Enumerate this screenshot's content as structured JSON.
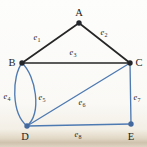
{
  "figure": {
    "type": "graph-diagram"
  },
  "colors": {
    "background": "#fbfaf7",
    "page_edge_strip": "#cfc3ae",
    "edge_black": "#262626",
    "edge_blue": "#4e7ab2",
    "vertex_dark": "#23262b",
    "vertex_blue": "#44699f",
    "label_text": "#2b2b2b"
  },
  "vertices": [
    {
      "id": "A",
      "label": "A",
      "x": 79,
      "y": 23,
      "label_x": 79,
      "label_y": 16,
      "dot": "dark"
    },
    {
      "id": "B",
      "label": "B",
      "x": 22,
      "y": 63,
      "label_x": 12,
      "label_y": 66,
      "dot": "dark"
    },
    {
      "id": "C",
      "label": "C",
      "x": 130,
      "y": 63,
      "label_x": 139,
      "label_y": 66,
      "dot": "dark"
    },
    {
      "id": "D",
      "label": "D",
      "x": 27,
      "y": 126,
      "label_x": 25,
      "label_y": 140,
      "dot": "blue"
    },
    {
      "id": "E",
      "label": "E",
      "x": 131,
      "y": 124,
      "label_x": 131,
      "label_y": 140,
      "dot": "blue"
    }
  ],
  "edges": [
    {
      "id": "e1",
      "symbol": "e",
      "sub": "1",
      "from": "B",
      "to": "A",
      "color": "black",
      "shape": "line",
      "label_x": 37,
      "label_y": 40
    },
    {
      "id": "e2",
      "symbol": "e",
      "sub": "2",
      "from": "A",
      "to": "C",
      "color": "black",
      "shape": "line",
      "label_x": 104,
      "label_y": 35
    },
    {
      "id": "e3",
      "symbol": "e",
      "sub": "3",
      "from": "B",
      "to": "C",
      "color": "black",
      "shape": "line",
      "label_x": 73,
      "label_y": 55
    },
    {
      "id": "e4",
      "symbol": "e",
      "sub": "4",
      "from": "B",
      "to": "D",
      "color": "blue",
      "shape": "curve",
      "c1": [
        12,
        76
      ],
      "c2": [
        11,
        113
      ],
      "label_x": 7,
      "label_y": 99
    },
    {
      "id": "e5",
      "symbol": "e",
      "sub": "5",
      "from": "B",
      "to": "D",
      "color": "blue",
      "shape": "curve",
      "c1": [
        36,
        76
      ],
      "c2": [
        42,
        113
      ],
      "label_x": 42,
      "label_y": 100
    },
    {
      "id": "e6",
      "symbol": "e",
      "sub": "6",
      "from": "D",
      "to": "C",
      "color": "blue",
      "shape": "line",
      "label_x": 82,
      "label_y": 105
    },
    {
      "id": "e7",
      "symbol": "e",
      "sub": "7",
      "from": "C",
      "to": "E",
      "color": "blue",
      "shape": "line",
      "label_x": 137,
      "label_y": 100
    },
    {
      "id": "e8",
      "symbol": "e",
      "sub": "8",
      "from": "D",
      "to": "E",
      "color": "blue",
      "shape": "line",
      "label_x": 78,
      "label_y": 137
    }
  ]
}
